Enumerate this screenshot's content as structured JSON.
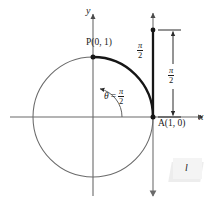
{
  "figure": {
    "background_color": "#ffffff",
    "ink_color": "#4a4a4a",
    "bold_ink_color": "#1a1a1a"
  },
  "axes": {
    "x_label": "x",
    "y_label": "y",
    "origin": {
      "x": 93,
      "y": 117
    }
  },
  "circle": {
    "center_x": 93,
    "center_y": 117,
    "radius": 60
  },
  "points": [
    {
      "name": "P",
      "label": "P(0, 1)",
      "x": 93,
      "y": 57
    },
    {
      "name": "A",
      "label": "A(1, 0)",
      "x": 153,
      "y": 117
    }
  ],
  "arc": {
    "label_numerator": "π",
    "label_denominator": "2",
    "from": "A(1, 0)",
    "to": "P(0, 1)"
  },
  "angle": {
    "symbol": "θ",
    "equals": "=",
    "numerator": "π",
    "denominator": "2"
  },
  "tangent_line": {
    "label": "l",
    "x_position": 153
  },
  "measure": {
    "numerator": "π",
    "denominator": "2",
    "from_y": 30,
    "to_y": 117
  }
}
